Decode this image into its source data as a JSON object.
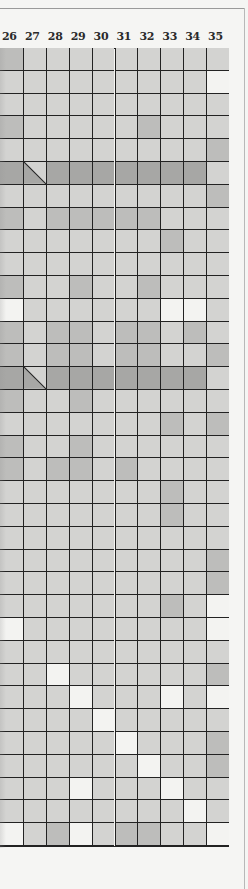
{
  "colors": {
    "light": "#d3d3d1",
    "medium": "#bdbdbb",
    "dark": "#a7a7a5",
    "white": "#f3f3f1"
  },
  "table": {
    "column_headers": [
      "26",
      "27",
      "28",
      "29",
      "30",
      "31",
      "32",
      "33",
      "34",
      "35"
    ],
    "legend_note": "Cell shading values: L=light, M=medium, D=dark, W=white, S=diagonal split (light upper-right, dark lower-left)",
    "rows": [
      [
        "M",
        "L",
        "L",
        "L",
        "L",
        "L",
        "L",
        "L",
        "L",
        "L"
      ],
      [
        "L",
        "L",
        "L",
        "L",
        "L",
        "L",
        "L",
        "L",
        "L",
        "W"
      ],
      [
        "L",
        "L",
        "L",
        "L",
        "L",
        "L",
        "L",
        "L",
        "L",
        "L"
      ],
      [
        "M",
        "L",
        "L",
        "L",
        "L",
        "L",
        "M",
        "L",
        "L",
        "L"
      ],
      [
        "L",
        "L",
        "L",
        "L",
        "L",
        "L",
        "L",
        "L",
        "L",
        "M"
      ],
      [
        "D",
        "S",
        "D",
        "D",
        "D",
        "D",
        "D",
        "D",
        "D",
        "L"
      ],
      [
        "L",
        "L",
        "L",
        "L",
        "L",
        "L",
        "L",
        "L",
        "L",
        "M"
      ],
      [
        "M",
        "L",
        "M",
        "M",
        "M",
        "M",
        "M",
        "L",
        "L",
        "L"
      ],
      [
        "L",
        "L",
        "L",
        "L",
        "L",
        "L",
        "L",
        "M",
        "L",
        "L"
      ],
      [
        "L",
        "L",
        "L",
        "L",
        "L",
        "L",
        "L",
        "L",
        "L",
        "L"
      ],
      [
        "M",
        "L",
        "L",
        "M",
        "L",
        "L",
        "M",
        "L",
        "L",
        "L"
      ],
      [
        "W",
        "L",
        "L",
        "L",
        "L",
        "L",
        "L",
        "W",
        "W",
        "L"
      ],
      [
        "M",
        "L",
        "M",
        "M",
        "L",
        "M",
        "M",
        "L",
        "M",
        "L"
      ],
      [
        "M",
        "L",
        "M",
        "M",
        "L",
        "M",
        "M",
        "L",
        "L",
        "M"
      ],
      [
        "D",
        "S",
        "D",
        "D",
        "D",
        "D",
        "D",
        "D",
        "D",
        "L"
      ],
      [
        "M",
        "L",
        "L",
        "M",
        "L",
        "L",
        "L",
        "L",
        "L",
        "L"
      ],
      [
        "L",
        "L",
        "L",
        "L",
        "L",
        "L",
        "L",
        "M",
        "L",
        "M"
      ],
      [
        "M",
        "L",
        "L",
        "M",
        "L",
        "L",
        "L",
        "L",
        "L",
        "L"
      ],
      [
        "M",
        "L",
        "M",
        "M",
        "L",
        "M",
        "L",
        "L",
        "L",
        "L"
      ],
      [
        "L",
        "L",
        "L",
        "L",
        "L",
        "L",
        "L",
        "M",
        "L",
        "L"
      ],
      [
        "L",
        "L",
        "L",
        "L",
        "L",
        "L",
        "L",
        "M",
        "L",
        "L"
      ],
      [
        "L",
        "L",
        "L",
        "L",
        "L",
        "L",
        "L",
        "L",
        "L",
        "L"
      ],
      [
        "L",
        "L",
        "L",
        "L",
        "L",
        "L",
        "L",
        "L",
        "L",
        "M"
      ],
      [
        "L",
        "L",
        "L",
        "L",
        "L",
        "L",
        "L",
        "L",
        "L",
        "M"
      ],
      [
        "L",
        "L",
        "L",
        "L",
        "L",
        "L",
        "L",
        "M",
        "L",
        "W"
      ],
      [
        "W",
        "L",
        "L",
        "L",
        "L",
        "L",
        "L",
        "L",
        "L",
        "W"
      ],
      [
        "L",
        "L",
        "L",
        "L",
        "L",
        "L",
        "L",
        "L",
        "L",
        "L"
      ],
      [
        "L",
        "L",
        "W",
        "L",
        "L",
        "L",
        "L",
        "L",
        "L",
        "M"
      ],
      [
        "L",
        "L",
        "L",
        "W",
        "L",
        "L",
        "L",
        "W",
        "L",
        "W"
      ],
      [
        "L",
        "L",
        "L",
        "L",
        "W",
        "L",
        "L",
        "L",
        "L",
        "L"
      ],
      [
        "L",
        "L",
        "L",
        "L",
        "L",
        "W",
        "L",
        "L",
        "L",
        "M"
      ],
      [
        "L",
        "L",
        "L",
        "L",
        "L",
        "L",
        "W",
        "L",
        "L",
        "M"
      ],
      [
        "L",
        "L",
        "L",
        "W",
        "L",
        "L",
        "L",
        "W",
        "L",
        "L"
      ],
      [
        "L",
        "L",
        "L",
        "L",
        "L",
        "L",
        "L",
        "L",
        "W",
        "L"
      ],
      [
        "W",
        "L",
        "M",
        "W",
        "L",
        "M",
        "M",
        "L",
        "L",
        "W"
      ]
    ]
  }
}
